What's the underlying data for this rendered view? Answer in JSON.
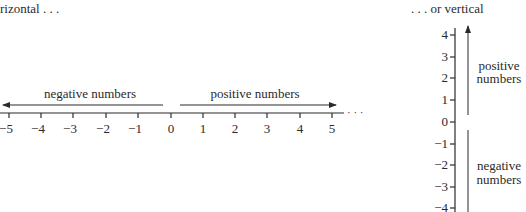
{
  "horizontal": {
    "caption": "rizontal . . .",
    "negative_label": "negative numbers",
    "positive_label": "positive numbers",
    "ticks": [
      "−5",
      "−4",
      "−3",
      "−2",
      "−1",
      "0",
      "1",
      "2",
      "3",
      "4",
      "5"
    ],
    "continuation": "· · ·"
  },
  "vertical": {
    "caption": ". . . or vertical",
    "positive_label_line1": "positive",
    "positive_label_line2": "numbers",
    "negative_label_line1": "negative",
    "negative_label_line2": "numbers",
    "ticks": [
      "4",
      "3",
      "2",
      "1",
      "0",
      "−1",
      "−2",
      "−3",
      "−4"
    ]
  },
  "colors": {
    "ink": "#2a2a2a",
    "background": "#ffffff"
  }
}
